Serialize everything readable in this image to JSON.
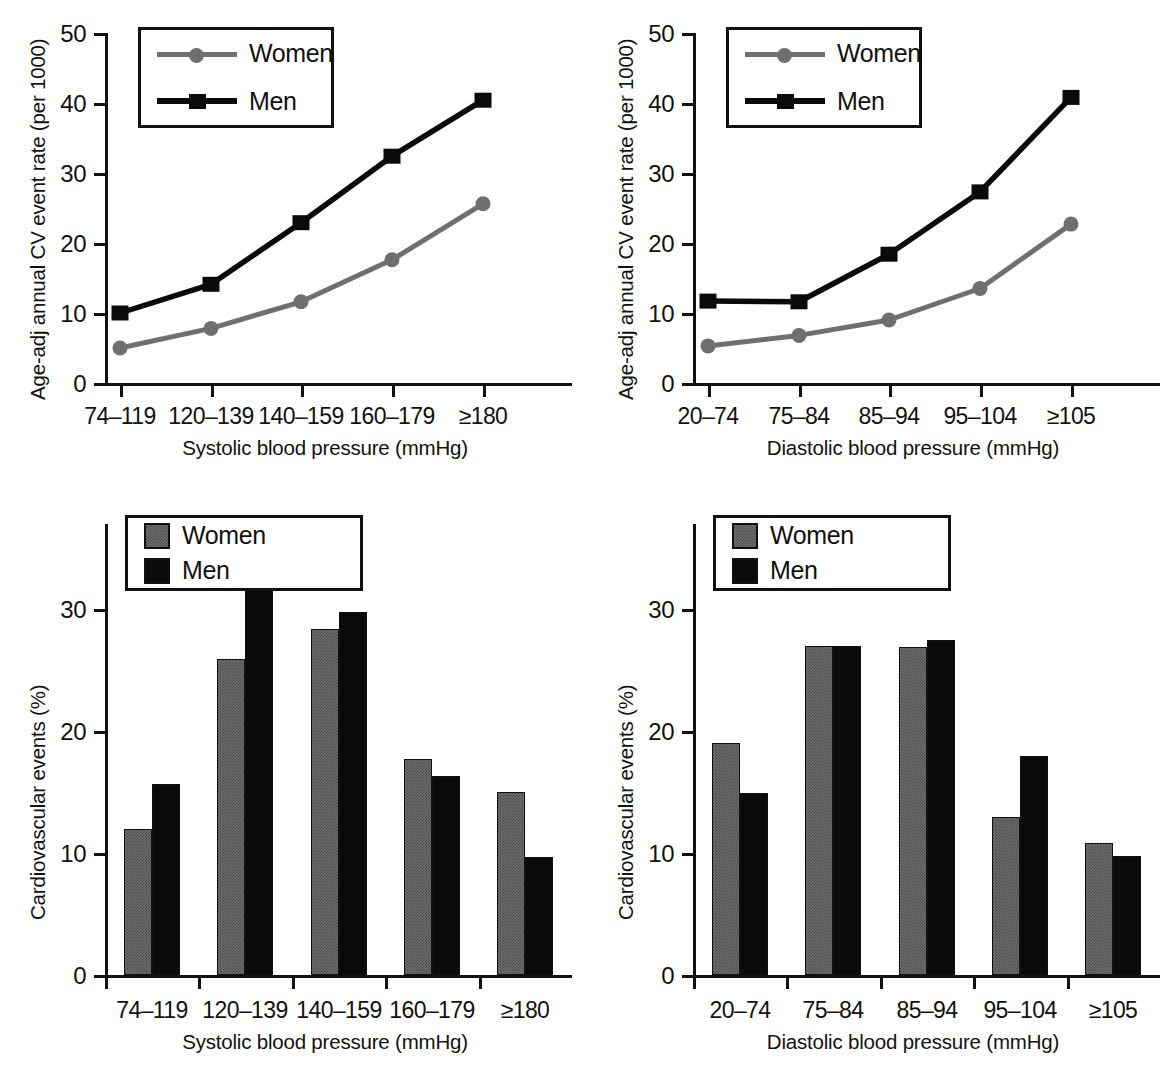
{
  "series_names": {
    "women": "Women",
    "men": "Men"
  },
  "colors": {
    "women": "#6f6f6f",
    "men": "#0a0a0a",
    "axis": "#111111",
    "background": "#ffffff"
  },
  "panels": {
    "top_left": {
      "ylabel": "Age-adj annual CV event rate (per 1000)",
      "xlabel": "Systolic blood pressure (mmHg)",
      "legend": {
        "women": "Women",
        "men": "Men"
      }
    },
    "top_right": {
      "ylabel": "Age-adj annual CV event rate (per 1000)",
      "xlabel": "Diastolic blood pressure (mmHg)",
      "legend": {
        "women": "Women",
        "men": "Men"
      }
    },
    "bottom_left": {
      "ylabel": "Cardiovascular events (%)",
      "xlabel": "Systolic blood pressure (mmHg)",
      "legend": {
        "women": "Women",
        "men": "Men"
      }
    },
    "bottom_right": {
      "ylabel": "Cardiovascular events (%)",
      "xlabel": "Diastolic blood pressure (mmHg)",
      "legend": {
        "women": "Women",
        "men": "Men"
      }
    }
  },
  "caption_fragment": "",
  "chart_data": [
    {
      "id": "top-left-line",
      "type": "line",
      "title": "",
      "xlabel": "Systolic blood pressure (mmHg)",
      "ylabel": "Age-adj annual CV event rate (per 1000)",
      "categories": [
        "74–119",
        "120–139",
        "140–159",
        "160–179",
        "≥180"
      ],
      "ylim": [
        0,
        50
      ],
      "yticks": [
        0,
        10,
        20,
        30,
        40,
        50
      ],
      "grid": false,
      "legend_position": "top-left",
      "series": [
        {
          "name": "Women",
          "color": "#6f6f6f",
          "marker": "circle",
          "values": [
            5.0,
            7.8,
            11.6,
            17.6,
            25.6
          ]
        },
        {
          "name": "Men",
          "color": "#0a0a0a",
          "marker": "square",
          "values": [
            10.0,
            14.1,
            22.9,
            32.4,
            40.4
          ]
        }
      ]
    },
    {
      "id": "top-right-line",
      "type": "line",
      "title": "",
      "xlabel": "Diastolic blood pressure (mmHg)",
      "ylabel": "Age-adj annual CV event rate (per 1000)",
      "categories": [
        "20–74",
        "75–84",
        "85–94",
        "95–104",
        "≥105"
      ],
      "ylim": [
        0,
        50
      ],
      "yticks": [
        0,
        10,
        20,
        30,
        40,
        50
      ],
      "grid": false,
      "legend_position": "top-left",
      "series": [
        {
          "name": "Women",
          "color": "#6f6f6f",
          "marker": "circle",
          "values": [
            5.3,
            6.8,
            9.0,
            13.5,
            22.7
          ]
        },
        {
          "name": "Men",
          "color": "#0a0a0a",
          "marker": "square",
          "values": [
            11.7,
            11.6,
            18.4,
            27.3,
            40.8
          ]
        }
      ]
    },
    {
      "id": "bottom-left-bar",
      "type": "bar",
      "title": "",
      "xlabel": "Systolic blood pressure (mmHg)",
      "ylabel": "Cardiovascular events (%)",
      "categories": [
        "74–119",
        "120–139",
        "140–159",
        "160–179",
        "≥180"
      ],
      "ylim": [
        0,
        37
      ],
      "yticks": [
        0,
        10,
        20,
        30
      ],
      "grid": false,
      "legend_position": "top-left",
      "series": [
        {
          "name": "Women",
          "color": "#6f6f6f",
          "values": [
            12.0,
            25.9,
            28.4,
            17.7,
            15.0
          ]
        },
        {
          "name": "Men",
          "color": "#0a0a0a",
          "values": [
            15.7,
            31.7,
            29.8,
            16.3,
            9.7
          ]
        }
      ]
    },
    {
      "id": "bottom-right-bar",
      "type": "bar",
      "title": "",
      "xlabel": "Diastolic blood pressure (mmHg)",
      "ylabel": "Cardiovascular events (%)",
      "categories": [
        "20–74",
        "75–84",
        "85–94",
        "95–104",
        "≥105"
      ],
      "ylim": [
        0,
        37
      ],
      "yticks": [
        0,
        10,
        20,
        30
      ],
      "grid": false,
      "legend_position": "top-left",
      "series": [
        {
          "name": "Women",
          "color": "#6f6f6f",
          "values": [
            19.0,
            27.0,
            26.9,
            13.0,
            10.8
          ]
        },
        {
          "name": "Men",
          "color": "#0a0a0a",
          "values": [
            14.9,
            27.0,
            27.5,
            18.0,
            9.8
          ]
        }
      ]
    }
  ]
}
